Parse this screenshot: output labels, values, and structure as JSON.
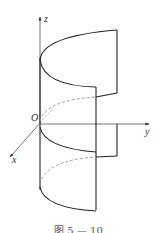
{
  "figure": {
    "caption": "图 5 — 10",
    "axes": {
      "z_label": "z",
      "y_label": "y",
      "x_label": "x",
      "origin_label": "O"
    },
    "colors": {
      "line": "#222222",
      "axis": "#555555",
      "dashed": "#888888",
      "background": "#ffffff"
    }
  }
}
